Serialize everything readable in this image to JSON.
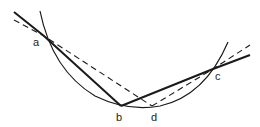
{
  "diagram": {
    "colors": {
      "stroke": "#1a1a1a",
      "label": "#222222",
      "background": "#ffffff"
    },
    "points": {
      "a": {
        "label": "a",
        "x": 44,
        "y": 36
      },
      "b": {
        "label": "b",
        "x": 121,
        "y": 106
      },
      "c": {
        "label": "c",
        "x": 213,
        "y": 69
      },
      "d": {
        "label": "d",
        "x": 152,
        "y": 106
      }
    },
    "arc": {
      "start": [
        40,
        11
      ],
      "bottom": [
        140,
        108
      ],
      "end": [
        228,
        42
      ]
    },
    "solid_path": [
      "start(14,12)",
      "a",
      "b",
      "c",
      "end(250,55)"
    ],
    "dashed_path": [
      "start(14,20)",
      "a",
      "d",
      "c",
      "end(250,45)"
    ]
  }
}
